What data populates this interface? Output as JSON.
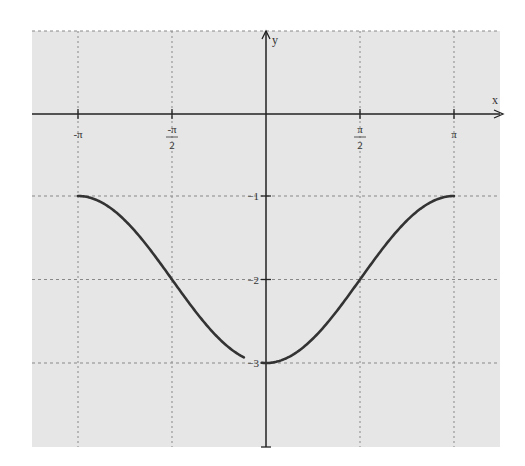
{
  "chart_data": {
    "type": "line",
    "title": "",
    "function": "y = -2 - cos(x)",
    "xlabel": "x",
    "ylabel": "y",
    "xlim": [
      -3.6,
      3.7
    ],
    "ylim": [
      -4,
      1
    ],
    "grid": true,
    "x_ticks": [
      {
        "value": -3.14159,
        "label": "-π",
        "num": "-π",
        "den": ""
      },
      {
        "value": -1.5708,
        "label": "-π/2",
        "num": "-π",
        "den": "2"
      },
      {
        "value": 1.5708,
        "label": "π/2",
        "num": "π",
        "den": "2"
      },
      {
        "value": 3.14159,
        "label": "π",
        "num": "π",
        "den": ""
      }
    ],
    "y_ticks": [
      {
        "value": -1,
        "label": "-1"
      },
      {
        "value": -2,
        "label": "-2"
      },
      {
        "value": -3,
        "label": "-3"
      }
    ],
    "series": [
      {
        "name": "left-branch",
        "x": [
          -3.14159,
          -2.5,
          -2.0,
          -1.5708,
          -1.0,
          -0.5,
          -0.37
        ],
        "y": [
          -1,
          -1.199,
          -1.584,
          -2,
          -2.54,
          -2.878,
          -2.932
        ]
      },
      {
        "name": "right-branch",
        "x": [
          -0.07,
          0,
          0.5,
          1.0,
          1.5708,
          2.0,
          2.5,
          3.14159
        ],
        "y": [
          -2.998,
          -3,
          -2.878,
          -2.54,
          -2,
          -1.584,
          -1.199,
          -1
        ]
      }
    ]
  },
  "colors": {
    "plot_background": "#e6e6e6",
    "page_background": "#ffffff",
    "curve": "#333333",
    "axis": "#222222",
    "grid": "#888888"
  }
}
